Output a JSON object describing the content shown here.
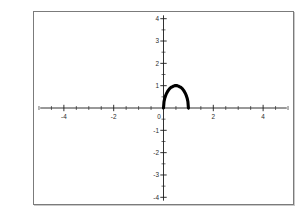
{
  "figure": {
    "background_color": "#ffffff",
    "frame_color": "#7b7b7b",
    "curve_color": "#000000",
    "axis_color": "#1b1b1b",
    "label_color": "#2b2b2b"
  },
  "chart_data": {
    "type": "line",
    "title": "",
    "xlabel": "",
    "ylabel": "",
    "xlim": [
      -5.2,
      5.2
    ],
    "ylim": [
      -4.3,
      4.3
    ],
    "grid": false,
    "legend": "none",
    "axes_style": "centered-cross",
    "x_ticks_major": [
      -4,
      -2,
      0,
      2,
      4
    ],
    "x_tick_labels": [
      "-4",
      "-2",
      "0",
      "2",
      "4"
    ],
    "y_ticks_major": [
      -4,
      -3,
      -2,
      -1,
      0,
      1,
      2,
      3,
      4
    ],
    "y_tick_labels": [
      "-4",
      "-3",
      "-2",
      "-1",
      "0",
      "1",
      "2",
      "3",
      "4"
    ],
    "x_minor_tick_step": 0.5,
    "y_minor_tick_step": 0.5,
    "series": [
      {
        "name": "arc",
        "expression": "y = 2*sqrt(x - x^2)",
        "x_domain": [
          0,
          1
        ],
        "x": [
          0.0,
          0.02,
          0.05,
          0.08,
          0.12,
          0.16,
          0.2,
          0.25,
          0.3,
          0.35,
          0.4,
          0.45,
          0.5,
          0.55,
          0.6,
          0.65,
          0.7,
          0.75,
          0.8,
          0.84,
          0.88,
          0.92,
          0.95,
          0.98,
          1.0
        ],
        "y": [
          0.0,
          0.28,
          0.44,
          0.54,
          0.65,
          0.73,
          0.8,
          0.87,
          0.92,
          0.95,
          0.98,
          1.0,
          1.0,
          1.0,
          0.98,
          0.95,
          0.92,
          0.87,
          0.8,
          0.73,
          0.65,
          0.54,
          0.44,
          0.28,
          0.0
        ]
      }
    ]
  }
}
